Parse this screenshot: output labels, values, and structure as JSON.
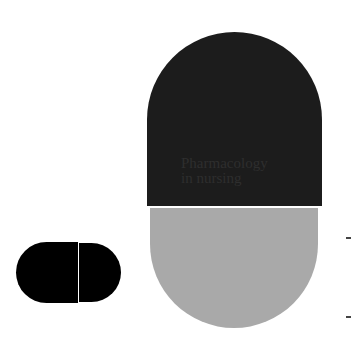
{
  "cover": {
    "title_line1": "Pharmacology",
    "title_line2": "in nursing"
  },
  "colors": {
    "capsule_top": "#1c1c1c",
    "capsule_bottom": "#a9a9a9",
    "small_pill": "#000000",
    "background": "#ffffff"
  }
}
